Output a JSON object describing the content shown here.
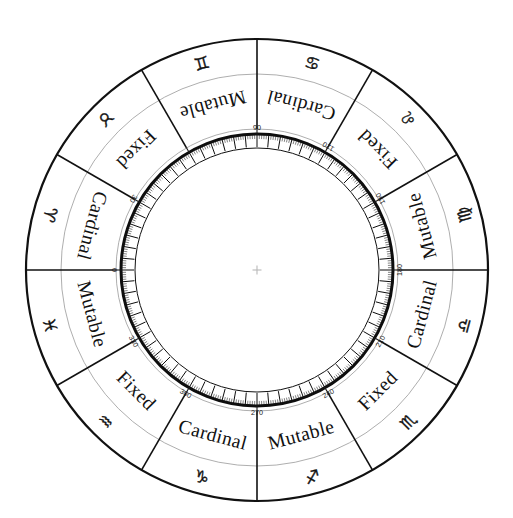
{
  "diagram": {
    "center": {
      "x": 257,
      "y": 270
    },
    "radii": {
      "outer": 231,
      "glyph_band_outer": 231,
      "glyph_band_inner": 196,
      "quality_band_inner": 141,
      "degree_ring_outer": 136,
      "degree_ring_inner": 122,
      "inner_blank": 120
    },
    "crosshair": {
      "size": 9,
      "color": "#b9b9b9"
    },
    "colors": {
      "ink": "#111111",
      "thin_ring": "#999999",
      "background": "#ffffff"
    },
    "signs": [
      {
        "name": "Aries",
        "glyph": "♈",
        "glyph_name": "aries-glyph",
        "quality": "Cardinal",
        "start_deg": 0,
        "end_deg": 30
      },
      {
        "name": "Taurus",
        "glyph": "♉",
        "glyph_name": "taurus-glyph",
        "quality": "Fixed",
        "start_deg": 30,
        "end_deg": 60
      },
      {
        "name": "Gemini",
        "glyph": "♊",
        "glyph_name": "gemini-glyph",
        "quality": "Mutable",
        "start_deg": 60,
        "end_deg": 90
      },
      {
        "name": "Cancer",
        "glyph": "♋",
        "glyph_name": "cancer-glyph",
        "quality": "Cardinal",
        "start_deg": 90,
        "end_deg": 120
      },
      {
        "name": "Leo",
        "glyph": "♌",
        "glyph_name": "leo-glyph",
        "quality": "Fixed",
        "start_deg": 120,
        "end_deg": 150
      },
      {
        "name": "Virgo",
        "glyph": "♍",
        "glyph_name": "virgo-glyph",
        "quality": "Mutable",
        "start_deg": 150,
        "end_deg": 180
      },
      {
        "name": "Libra",
        "glyph": "♎",
        "glyph_name": "libra-glyph",
        "quality": "Cardinal",
        "start_deg": 180,
        "end_deg": 210
      },
      {
        "name": "Scorpio",
        "glyph": "♏",
        "glyph_name": "scorpio-glyph",
        "quality": "Fixed",
        "start_deg": 210,
        "end_deg": 240
      },
      {
        "name": "Sagittarius",
        "glyph": "♐",
        "glyph_name": "sagittarius-glyph",
        "quality": "Mutable",
        "start_deg": 240,
        "end_deg": 270
      },
      {
        "name": "Capricorn",
        "glyph": "♑",
        "glyph_name": "capricorn-glyph",
        "quality": "Cardinal",
        "start_deg": 270,
        "end_deg": 300
      },
      {
        "name": "Aquarius",
        "glyph": "♒",
        "glyph_name": "aquarius-glyph",
        "quality": "Fixed",
        "start_deg": 300,
        "end_deg": 330
      },
      {
        "name": "Pisces",
        "glyph": "♓",
        "glyph_name": "pisces-glyph",
        "quality": "Mutable",
        "start_deg": 330,
        "end_deg": 360
      }
    ],
    "degree_labels": [
      {
        "text": "0",
        "deg": 0
      },
      {
        "text": "30",
        "deg": 30
      },
      {
        "text": "06",
        "deg": 90,
        "true_value": "90"
      },
      {
        "text": "120",
        "deg": 120
      },
      {
        "text": "150",
        "deg": 150
      },
      {
        "text": "180",
        "deg": 180
      },
      {
        "text": "210",
        "deg": 210
      },
      {
        "text": "240",
        "deg": 240
      },
      {
        "text": "270",
        "deg": 270
      },
      {
        "text": "300",
        "deg": 300
      },
      {
        "text": "330",
        "deg": 330
      }
    ],
    "degree_tick_step": 1,
    "degree_major_step": 5
  },
  "chart_data": {
    "type": "pie",
    "categories": [
      "Aries",
      "Taurus",
      "Gemini",
      "Cancer",
      "Leo",
      "Virgo",
      "Libra",
      "Scorpio",
      "Sagittarius",
      "Capricorn",
      "Aquarius",
      "Pisces"
    ],
    "values": [
      30,
      30,
      30,
      30,
      30,
      30,
      30,
      30,
      30,
      30,
      30,
      30
    ],
    "series": [
      {
        "name": "Modality",
        "values": [
          "Cardinal",
          "Fixed",
          "Mutable",
          "Cardinal",
          "Fixed",
          "Mutable",
          "Cardinal",
          "Fixed",
          "Mutable",
          "Cardinal",
          "Fixed",
          "Mutable"
        ]
      }
    ],
    "xlabel": "Ecliptic longitude (degrees)",
    "ylabel": "",
    "axis_range": [
      0,
      360
    ],
    "tick_labels": [
      "0",
      "30",
      "90",
      "120",
      "150",
      "180",
      "210",
      "240",
      "270",
      "300",
      "330"
    ],
    "grid": false,
    "legend": "none"
  }
}
